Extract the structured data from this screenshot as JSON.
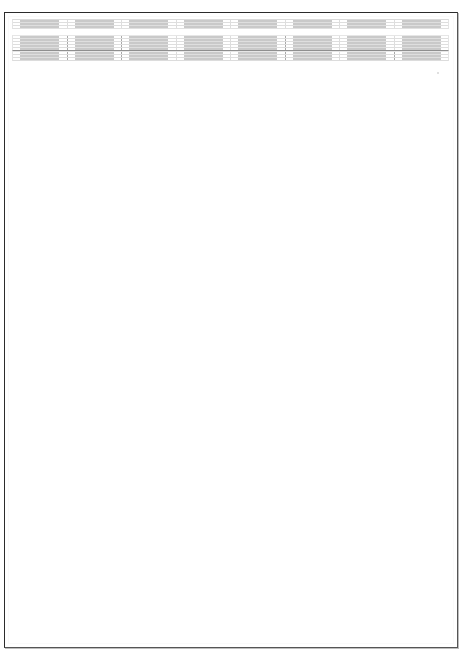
{
  "document": {
    "title": "Blank Grid Form Sheet",
    "page_background_color": "#ffffff",
    "sheet_border_color": "#2b2b2b",
    "grid_line_color": "#dedede",
    "section_divider_color": "#9a9a9a",
    "cell_box_border_color": "#c9c9c9",
    "columns": 8,
    "total_rows": 11,
    "visible_text": "",
    "annotation": ""
  },
  "grid": {
    "column_count": 8,
    "sections": [
      {
        "name": "section-top",
        "row_count": 3,
        "rows": [
          {
            "name": "row-1",
            "cells": [
              "",
              "",
              "",
              "",
              "",
              "",
              "",
              ""
            ]
          },
          {
            "name": "row-2",
            "cells": [
              "",
              "",
              "",
              "",
              "",
              "",
              "",
              ""
            ]
          },
          {
            "name": "row-3",
            "cells": [
              "",
              "",
              "",
              "",
              "",
              "",
              "",
              ""
            ]
          }
        ]
      },
      {
        "name": "section-middle",
        "row_count": 5,
        "rows": [
          {
            "name": "row-4",
            "cells": [
              "",
              "",
              "",
              "",
              "",
              "",
              "",
              ""
            ]
          },
          {
            "name": "row-5",
            "cells": [
              "",
              "",
              "",
              "",
              "",
              "",
              "",
              ""
            ]
          },
          {
            "name": "row-6",
            "cells": [
              "",
              "",
              "",
              "",
              "",
              "",
              "",
              ""
            ]
          },
          {
            "name": "row-7",
            "cells": [
              "",
              "",
              "",
              "",
              "",
              "",
              "",
              ""
            ]
          },
          {
            "name": "row-8",
            "cells": [
              "",
              "",
              "",
              "",
              "",
              "",
              "",
              ""
            ]
          }
        ]
      },
      {
        "name": "section-bottom",
        "row_count": 3,
        "rows": [
          {
            "name": "row-9",
            "cells": [
              "",
              "",
              "",
              "",
              "",
              "",
              "",
              ""
            ]
          },
          {
            "name": "row-10",
            "cells": [
              "",
              "",
              "",
              "",
              "",
              "",
              "",
              ""
            ]
          },
          {
            "name": "row-11",
            "cells": [
              "",
              "",
              "",
              "",
              "",
              "",
              "",
              ""
            ]
          }
        ]
      }
    ]
  }
}
